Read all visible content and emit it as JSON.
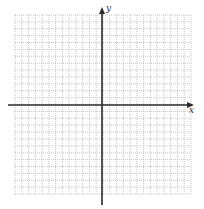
{
  "diagram": {
    "type": "coordinate-grid",
    "grid": {
      "x_min": 15,
      "x_max": 191,
      "y_min": 15,
      "y_max": 194,
      "cells_x": 26,
      "cells_y": 26,
      "line_color": "#b8b8b8",
      "dash": "1,1"
    },
    "axes": {
      "color": "#2b2b2b",
      "x_axis_y": 105,
      "y_axis_x": 102,
      "x_label": "x",
      "y_label": "y"
    }
  }
}
